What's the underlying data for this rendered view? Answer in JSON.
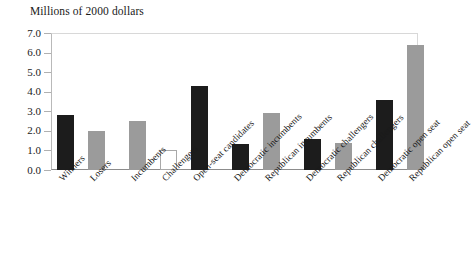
{
  "chart_data": {
    "type": "bar",
    "title": "Millions of 2000 dollars",
    "xlabel": "",
    "ylabel": "Millions of 2000 dollars",
    "ylim": [
      0.0,
      7.0
    ],
    "ytick_labels": [
      "0.0",
      "1.0",
      "2.0",
      "3.0",
      "4.0",
      "5.0",
      "6.0",
      "7.0"
    ],
    "ytick_values": [
      0.0,
      1.0,
      2.0,
      3.0,
      4.0,
      5.0,
      6.0,
      7.0
    ],
    "grid": false,
    "legend": "none",
    "categories": [
      "Winners",
      "Losers",
      "Incumbents",
      "Challengers",
      "Open-seat candidates",
      "Democratic incumbents",
      "Republican incumbents",
      "Democratic challengers",
      "Republican challengers",
      "Democratic open seat",
      "Republican open seat"
    ],
    "values": [
      2.8,
      2.0,
      2.5,
      1.0,
      4.3,
      1.35,
      2.9,
      1.6,
      1.4,
      3.6,
      6.4
    ],
    "bar_styles": [
      "black",
      "gray",
      "gray",
      "hollow",
      "black",
      "black",
      "gray",
      "black",
      "gray",
      "black",
      "gray"
    ],
    "colors": {
      "black": "#1c1c1c",
      "gray": "#9b9b9b",
      "hollow": "#ffffff",
      "hollow_outline": "#a9a9a9",
      "axis": "#8c8c8c",
      "text": "#1a1a1a"
    }
  }
}
